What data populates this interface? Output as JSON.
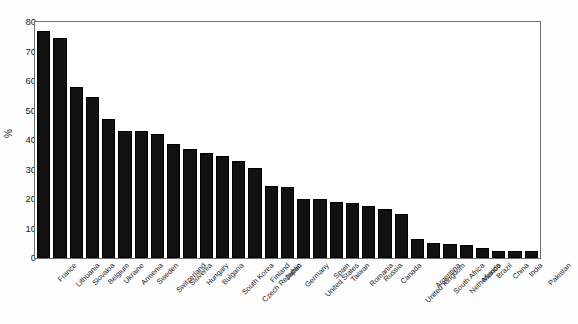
{
  "chart_data": {
    "type": "bar",
    "title": "",
    "xlabel": "",
    "ylabel": "%",
    "ylim": [
      0,
      80
    ],
    "yticks": [
      0,
      10,
      20,
      30,
      40,
      50,
      60,
      70,
      80
    ],
    "grid": false,
    "legend": false,
    "bar_color": "#111111",
    "categories": [
      "France",
      "Lithuania",
      "Slovakia",
      "Belgium",
      "Ukraine",
      "Armenia",
      "Sweden",
      "Switzerland",
      "Slovenia",
      "Hungary",
      "Bulgaria",
      "South Korea",
      "Czech Republic",
      "Finland",
      "Japan",
      "Germany",
      "United States",
      "Spain",
      "Taiwan",
      "Romania",
      "Russia",
      "Canada",
      "United Kingdom",
      "Argentina",
      "South Africa",
      "Netherlands",
      "Mexico",
      "Brazil",
      "China",
      "India",
      "Pakistan"
    ],
    "values": [
      77.0,
      74.5,
      58.0,
      54.5,
      47.0,
      43.0,
      43.0,
      42.0,
      38.5,
      37.0,
      35.5,
      34.5,
      33.0,
      30.5,
      24.5,
      24.0,
      20.0,
      20.0,
      19.0,
      18.5,
      17.5,
      16.5,
      15.0,
      6.5,
      5.0,
      4.7,
      4.5,
      3.5,
      2.5,
      2.3,
      2.3
    ]
  }
}
